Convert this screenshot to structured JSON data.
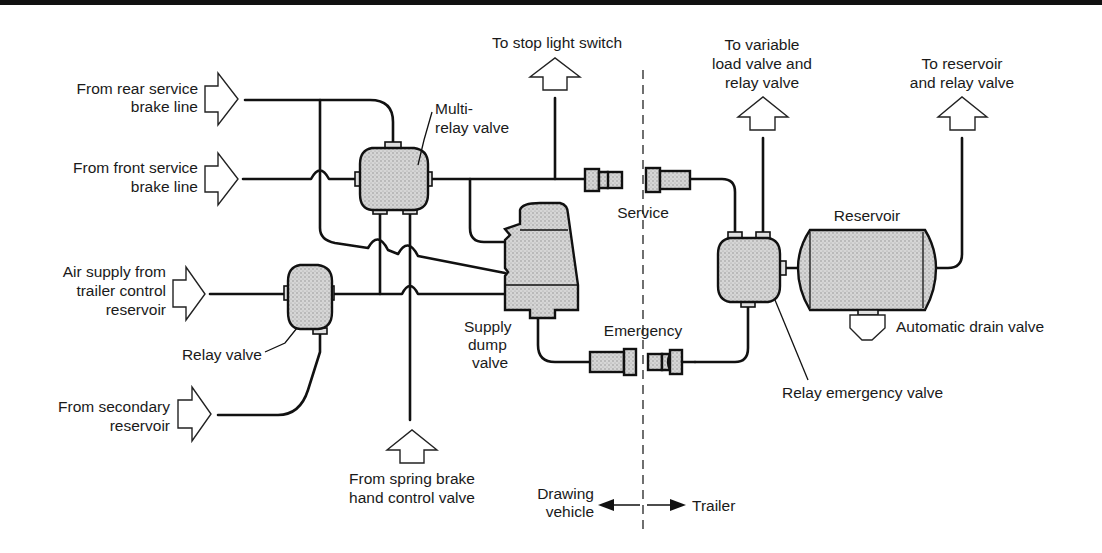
{
  "diagram": {
    "inputs": {
      "rear_service": [
        "From rear service",
        "brake line"
      ],
      "front_service": [
        "From front service",
        "brake line"
      ],
      "air_supply": [
        "Air supply from",
        "trailer control",
        "reservoir"
      ],
      "secondary": [
        "From secondary",
        "reservoir"
      ],
      "spring_brake": [
        "From spring brake",
        "hand control valve"
      ]
    },
    "outputs": {
      "stop_light": "To stop light switch",
      "variable_load": [
        "To variable",
        "load valve and",
        "relay valve"
      ],
      "reservoir_relay": [
        "To reservoir",
        "and relay valve"
      ]
    },
    "components": {
      "multi_relay": [
        "Multi-",
        "relay valve"
      ],
      "relay_valve": "Relay valve",
      "supply_dump": [
        "Supply",
        "dump",
        "valve"
      ],
      "reservoir": "Reservoir",
      "drain": "Automatic drain valve",
      "relay_emergency": "Relay emergency valve"
    },
    "couplings": {
      "service": "Service",
      "emergency": "Emergency"
    },
    "sides": {
      "drawing_vehicle": [
        "Drawing",
        "vehicle"
      ],
      "trailer": "Trailer"
    }
  }
}
